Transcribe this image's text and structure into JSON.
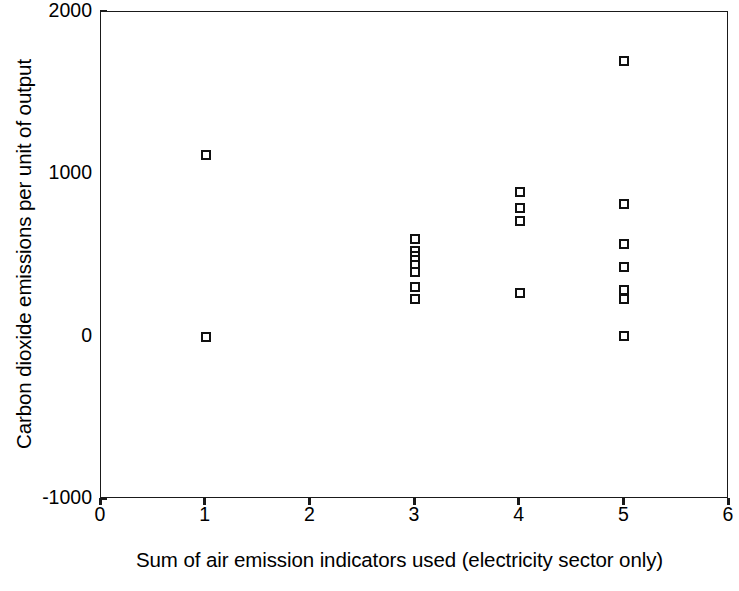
{
  "chart": {
    "type": "scatter",
    "title": "",
    "xlabel": "Sum of air emission indicators used (electricity sector only)",
    "ylabel": "Carbon dioxide emissions per unit of output",
    "xlim": [
      0,
      6
    ],
    "ylim": [
      -1000,
      2000
    ],
    "xticks": [
      "0",
      "1",
      "2",
      "3",
      "4",
      "5",
      "6"
    ],
    "yticks": [
      "2000",
      "1000",
      "0",
      "-1000"
    ],
    "grid": false,
    "legend": null,
    "marker_style": "open-square",
    "marker_color": "#111111"
  },
  "chart_data": {
    "type": "scatter",
    "title": "",
    "xlabel": "Sum of air emission indicators used (electricity sector only)",
    "ylabel": "Carbon dioxide emissions per unit of output",
    "xlim": [
      0,
      6
    ],
    "ylim": [
      -1000,
      2000
    ],
    "xticks": [
      0,
      1,
      2,
      3,
      4,
      5,
      6
    ],
    "yticks": [
      -1000,
      0,
      1000,
      2000
    ],
    "grid": false,
    "legend_position": "none",
    "series": [
      {
        "name": "Electricity sector observations",
        "marker": "open-square",
        "color": "#111111",
        "points": [
          {
            "x": 1,
            "y": 1120
          },
          {
            "x": 1,
            "y": 0
          },
          {
            "x": 3,
            "y": 600
          },
          {
            "x": 3,
            "y": 525
          },
          {
            "x": 3,
            "y": 500
          },
          {
            "x": 3,
            "y": 470
          },
          {
            "x": 3,
            "y": 440
          },
          {
            "x": 3,
            "y": 400
          },
          {
            "x": 3,
            "y": 305
          },
          {
            "x": 3,
            "y": 230
          },
          {
            "x": 4,
            "y": 890
          },
          {
            "x": 4,
            "y": 790
          },
          {
            "x": 4,
            "y": 715
          },
          {
            "x": 4,
            "y": 270
          },
          {
            "x": 5,
            "y": 1700
          },
          {
            "x": 5,
            "y": 815
          },
          {
            "x": 5,
            "y": 570
          },
          {
            "x": 5,
            "y": 430
          },
          {
            "x": 5,
            "y": 290
          },
          {
            "x": 5,
            "y": 230
          },
          {
            "x": 5,
            "y": 5
          }
        ]
      }
    ]
  }
}
